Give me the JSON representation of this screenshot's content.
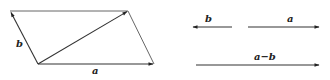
{
  "diagram": {
    "colors": {
      "stroke": "#333333",
      "text": "#222222",
      "background": "#ffffff"
    },
    "parallelogram": {
      "vertices": {
        "top_left": [
          10,
          11
        ],
        "top_right": [
          128,
          11
        ],
        "bottom_left": [
          38,
          64
        ],
        "bottom_right": [
          154,
          64
        ]
      },
      "vectors": [
        {
          "id": "b",
          "label": "b",
          "from": [
            38,
            64
          ],
          "to": [
            10,
            11
          ]
        },
        {
          "id": "a",
          "label": "a",
          "from": [
            38,
            64
          ],
          "to": [
            154,
            64
          ]
        },
        {
          "id": "diagonal",
          "label": "",
          "from": [
            38,
            64
          ],
          "to": [
            128,
            11
          ]
        }
      ],
      "labels": {
        "b": "b",
        "a": "a"
      }
    },
    "right_panel": {
      "vectors": [
        {
          "id": "b",
          "label": "b",
          "from": [
            232,
            27
          ],
          "to": [
            192,
            27
          ]
        },
        {
          "id": "a",
          "label": "a",
          "from": [
            248,
            27
          ],
          "to": [
            320,
            27
          ]
        },
        {
          "id": "a_minus_b",
          "label": "a−b",
          "from": [
            196,
            65
          ],
          "to": [
            320,
            65
          ]
        }
      ],
      "labels": {
        "b": "b",
        "a": "a",
        "a_minus_b": "a−b"
      }
    }
  }
}
